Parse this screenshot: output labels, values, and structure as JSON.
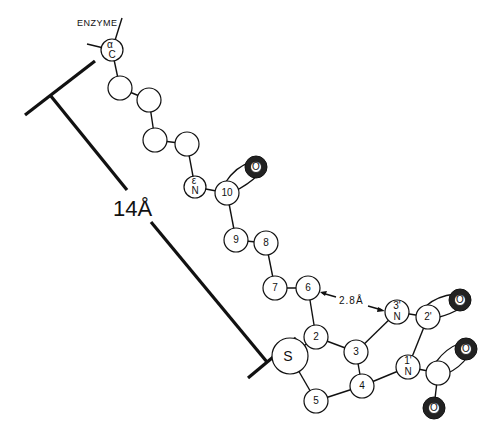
{
  "figure": {
    "enzyme_label": "ENZYME",
    "distance_long": "14Å",
    "distance_short": "2.8Å",
    "atoms": {
      "c_alpha": {
        "greek": "α",
        "element": "C"
      },
      "n_epsilon": {
        "greek": "ε",
        "element": "N"
      },
      "c10": "10",
      "c9": "9",
      "c8": "8",
      "c7": "7",
      "c6": "6",
      "c2": "2",
      "c3": "3",
      "c4": "4",
      "c5": "5",
      "sulfur": "S",
      "n3prime": {
        "num": "3'",
        "element": "N"
      },
      "c2prime": "2'",
      "n1prime": {
        "num": "1'",
        "element": "N"
      },
      "oxygen": "O"
    }
  }
}
